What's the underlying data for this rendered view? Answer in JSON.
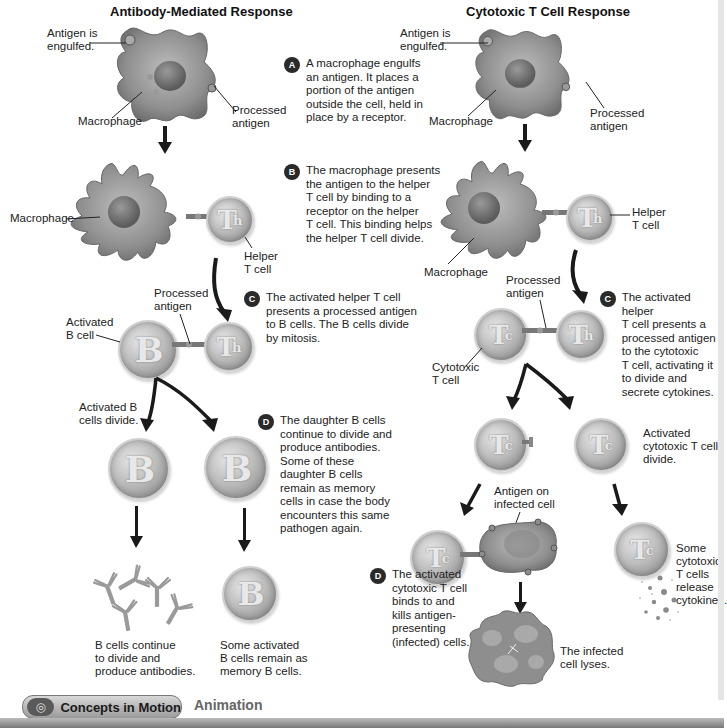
{
  "left_panel": {
    "title": "Antibody-Mediated Response",
    "labels": {
      "antigen_engulfed_1": "Antigen is",
      "antigen_engulfed_2": "engulfed.",
      "macrophage_a": "Macrophage",
      "processed_antigen_a_1": "Processed",
      "processed_antigen_a_2": "antigen",
      "macrophage_b": "Macrophage",
      "helper_t_1": "Helper",
      "helper_t_2": "T cell",
      "processed_antigen_c_1": "Processed",
      "processed_antigen_c_2": "antigen",
      "activated_b_1": "Activated",
      "activated_b_2": "B cell",
      "b_divide_1": "Activated B",
      "b_divide_2": "cells divide.",
      "antibodies_1": "B cells continue",
      "antibodies_2": "to divide and",
      "antibodies_3": "produce antibodies.",
      "memory_1": "Some activated",
      "memory_2": "B cells remain as",
      "memory_3": "memory B cells."
    },
    "cell_glyphs": {
      "helper": "T",
      "helper_sub": "h",
      "b": "B"
    }
  },
  "center_steps": [
    {
      "badge": "A",
      "lines": [
        "A macrophage engulfs",
        "an antigen. It places a",
        "portion of the antigen",
        "outside the cell, held in",
        "place by a receptor."
      ]
    },
    {
      "badge": "B",
      "lines": [
        "The macrophage presents",
        "the antigen to the helper",
        "T cell by binding to a",
        "receptor on the helper",
        "T cell. This binding helps",
        "the helper T cell divide."
      ]
    },
    {
      "badge": "C",
      "lines": [
        "The activated helper T cell",
        "presents a processed antigen",
        "to B cells. The B cells divide",
        "by mitosis."
      ]
    },
    {
      "badge": "D",
      "lines": [
        "The daughter B cells",
        "continue to divide and",
        "produce antibodies.",
        "Some of these",
        "daughter B cells",
        "remain as memory",
        "cells in case the body",
        "encounters this same",
        "pathogen again."
      ]
    }
  ],
  "right_panel": {
    "title": "Cytotoxic T Cell Response",
    "labels": {
      "antigen_engulfed_1": "Antigen is",
      "antigen_engulfed_2": "engulfed.",
      "macrophage_a": "Macrophage",
      "processed_antigen_a_1": "Processed",
      "processed_antigen_a_2": "antigen",
      "helper_t_1": "Helper",
      "helper_t_2": "T cell",
      "macrophage_b": "Macrophage",
      "processed_antigen_c_1": "Processed",
      "processed_antigen_c_2": "antigen",
      "cytotoxic_1": "Cytotoxic",
      "cytotoxic_2": "T cell",
      "tc_divide_1": "Activated",
      "tc_divide_2": "cytotoxic T cells",
      "tc_divide_3": "divide.",
      "antigen_infected_1": "Antigen on",
      "antigen_infected_2": "infected cell",
      "cytokines_1": "Some",
      "cytokines_2": "cytotoxic",
      "cytokines_3": "T cells",
      "cytokines_4": "release",
      "cytokines_5": "cytokines.",
      "lyses_1": "The infected",
      "lyses_2": "cell lyses."
    },
    "step_c": {
      "badge": "C",
      "lines": [
        "The activated helper",
        "T cell presents a",
        "processed antigen",
        "to the cytotoxic",
        "T cell, activating it",
        "to divide and",
        "secrete cytokines."
      ]
    },
    "step_d": {
      "badge": "D",
      "lines": [
        "The activated",
        "cytotoxic T cell",
        "binds to and",
        "kills antigen-",
        "presenting",
        "(infected) cells."
      ]
    },
    "cell_glyphs": {
      "cytotoxic": "T",
      "cytotoxic_sub": "c",
      "helper": "T",
      "helper_sub": "h"
    }
  },
  "footer": {
    "concepts_label": "Concepts in Motion",
    "animation_label": "Animation",
    "icon": "concentric-circles-icon"
  }
}
